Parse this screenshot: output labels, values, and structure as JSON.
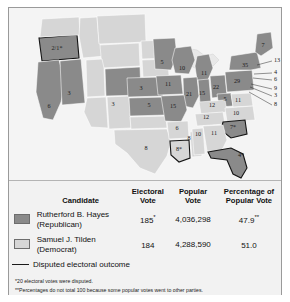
{
  "figure": {
    "type": "electoral-map-with-legend",
    "map_title": "",
    "colors": {
      "hayes_fill": "#8a8a8a",
      "tilden_fill": "#d6d6d6",
      "disputed_outline": "#141414",
      "panel_bg": "#f2f2f2",
      "border": "#9a9a9a"
    }
  },
  "chart_data": {
    "type": "map",
    "title": "",
    "legend_position": "bottom",
    "series": [
      {
        "name": "Rutherford B. Hayes (Republican)",
        "color": "#8a8a8a"
      },
      {
        "name": "Samuel J. Tilden (Democrat)",
        "color": "#d6d6d6"
      }
    ],
    "states": [
      {
        "label": "2/1*",
        "party": "hayes",
        "disputed": true,
        "x": 48,
        "y": 41
      },
      {
        "label": "6",
        "party": "hayes",
        "disputed": false,
        "x": 40,
        "y": 99
      },
      {
        "label": "3",
        "party": "hayes",
        "disputed": false,
        "x": 60,
        "y": 86
      },
      {
        "label": "3",
        "party": "hayes",
        "disputed": false,
        "x": 104,
        "y": 97
      },
      {
        "label": "3",
        "party": "hayes",
        "disputed": false,
        "x": 132,
        "y": 81
      },
      {
        "label": "5",
        "party": "hayes",
        "disputed": false,
        "x": 140,
        "y": 98
      },
      {
        "label": "8",
        "party": "tilden",
        "disputed": false,
        "x": 137,
        "y": 141
      },
      {
        "label": "15",
        "party": "tilden",
        "disputed": false,
        "x": 164,
        "y": 99
      },
      {
        "label": "6",
        "party": "tilden",
        "disputed": false,
        "x": 168,
        "y": 121
      },
      {
        "label": "8",
        "party": "tilden",
        "disputed": false,
        "x": 180,
        "y": 131
      },
      {
        "label": "8*",
        "party": "tilden",
        "disputed": true,
        "x": 170,
        "y": 142
      },
      {
        "label": "5",
        "party": "hayes",
        "disputed": false,
        "x": 153,
        "y": 55
      },
      {
        "label": "10",
        "party": "hayes",
        "disputed": false,
        "x": 173,
        "y": 61
      },
      {
        "label": "11",
        "party": "hayes",
        "disputed": false,
        "x": 159,
        "y": 77
      },
      {
        "label": "11",
        "party": "hayes",
        "disputed": false,
        "x": 195,
        "y": 66
      },
      {
        "label": "21",
        "party": "hayes",
        "disputed": false,
        "x": 180,
        "y": 87
      },
      {
        "label": "15",
        "party": "hayes",
        "disputed": false,
        "x": 193,
        "y": 86
      },
      {
        "label": "22",
        "party": "hayes",
        "disputed": false,
        "x": 207,
        "y": 80
      },
      {
        "label": "29",
        "party": "hayes",
        "disputed": false,
        "x": 228,
        "y": 74
      },
      {
        "label": "35",
        "party": "hayes",
        "disputed": false,
        "x": 236,
        "y": 58
      },
      {
        "label": "7",
        "party": "hayes",
        "disputed": false,
        "x": 254,
        "y": 38
      },
      {
        "label": "5",
        "party": "hayes",
        "disputed": false,
        "x": 216,
        "y": 92
      },
      {
        "label": "11",
        "party": "tilden",
        "disputed": false,
        "x": 229,
        "y": 93
      },
      {
        "label": "12",
        "party": "tilden",
        "disputed": false,
        "x": 203,
        "y": 98
      },
      {
        "label": "12",
        "party": "tilden",
        "disputed": false,
        "x": 197,
        "y": 110
      },
      {
        "label": "10",
        "party": "tilden",
        "disputed": false,
        "x": 227,
        "y": 106
      },
      {
        "label": "7*",
        "party": "hayes",
        "disputed": true,
        "x": 224,
        "y": 120
      },
      {
        "label": "11",
        "party": "tilden",
        "disputed": false,
        "x": 205,
        "y": 126
      },
      {
        "label": "10",
        "party": "tilden",
        "disputed": false,
        "x": 189,
        "y": 127
      },
      {
        "label": "4*",
        "party": "hayes",
        "disputed": true,
        "x": 232,
        "y": 148
      }
    ],
    "leader_labels": [
      {
        "label": "13",
        "x": 265,
        "y": 53,
        "tip_x": 248,
        "tip_y": 57
      },
      {
        "label": "4",
        "x": 265,
        "y": 65,
        "tip_x": 245,
        "tip_y": 66
      },
      {
        "label": "6",
        "x": 265,
        "y": 72,
        "tip_x": 244,
        "tip_y": 70
      },
      {
        "label": "9",
        "x": 265,
        "y": 81,
        "tip_x": 242,
        "tip_y": 76
      },
      {
        "label": "3",
        "x": 265,
        "y": 88,
        "tip_x": 241,
        "tip_y": 79
      },
      {
        "label": "8",
        "x": 265,
        "y": 97,
        "tip_x": 240,
        "tip_y": 84
      }
    ]
  },
  "table": {
    "headers": {
      "candidate": "Candidate",
      "electoral_vote_line1": "Electoral",
      "electoral_vote_line2": "Vote",
      "popular_vote_line1": "Popular",
      "popular_vote_line2": "Vote",
      "percentage_line1": "Percentage of",
      "percentage_line2": "Popular Vote"
    },
    "rows": [
      {
        "name_line1": "Rutherford B. Hayes",
        "name_line2": "(Republican)",
        "electoral_vote": "185",
        "electoral_vote_marker": "*",
        "popular_vote": "4,036,298",
        "percentage": "47.9",
        "percentage_marker": "**",
        "swatch_color": "#8a8a8a"
      },
      {
        "name_line1": "Samuel J. Tilden",
        "name_line2": "(Democrat)",
        "electoral_vote": "184",
        "electoral_vote_marker": "",
        "popular_vote": "4,288,590",
        "percentage": "51.0",
        "percentage_marker": "",
        "swatch_color": "#d6d6d6"
      }
    ],
    "disputed_label": "Disputed electoral outcome"
  },
  "footnotes": {
    "one": "*20 electoral votes were disputed.",
    "two": "**Percentages do not total 100 because some popular votes went to other parties."
  }
}
